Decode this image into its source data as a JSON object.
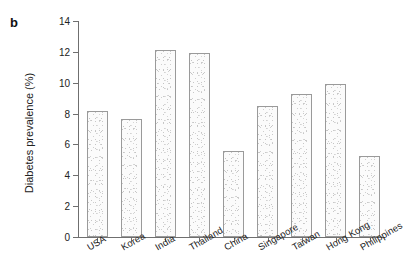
{
  "panel": {
    "label": "b"
  },
  "chart_data": {
    "type": "bar",
    "title": "",
    "subtitle": "",
    "xlabel": "",
    "ylabel": "Diabetes prevalence (%)",
    "ylim": [
      0,
      14
    ],
    "yticks": [
      "0",
      "2",
      "4",
      "6",
      "8",
      "10",
      "12",
      "14"
    ],
    "ytick_values": [
      0,
      2,
      4,
      6,
      8,
      10,
      12,
      14
    ],
    "grid": false,
    "legend": null,
    "legend_position": "none",
    "categories": [
      "USA",
      "Korea",
      "India",
      "Thailand",
      "China",
      "Singapore",
      "Taiwan",
      "Hong Kong",
      "Philippines"
    ],
    "values": [
      8.2,
      7.65,
      12.15,
      11.95,
      5.55,
      8.5,
      9.3,
      9.95,
      5.25
    ],
    "bar_fill": "#fbfbfb",
    "bar_edge": "#9a9a9a",
    "axis_color": "#6f6f6f",
    "xtick_label_rotation": -30
  }
}
